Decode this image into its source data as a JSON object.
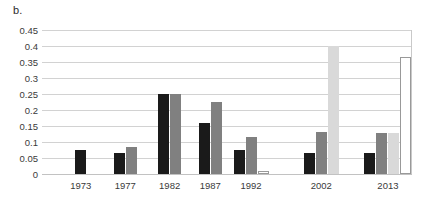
{
  "figure": {
    "panel_label": "b."
  },
  "chart_data": {
    "type": "bar",
    "title": "b.",
    "xlabel": "",
    "ylabel": "",
    "ylim": [
      0,
      0.45
    ],
    "grid": true,
    "legend": "none",
    "ytick_labels": [
      "0",
      "0.05",
      "0.1",
      "0.15",
      "0.2",
      "0.25",
      "0.3",
      "0.35",
      "0.4",
      "0.45"
    ],
    "ytick_values": [
      0,
      0.05,
      0.1,
      0.15,
      0.2,
      0.25,
      0.3,
      0.35,
      0.4,
      0.45
    ],
    "categories": [
      "1973",
      "1977",
      "1982",
      "1987",
      "1992",
      "2002",
      "2013"
    ],
    "category_positions": [
      0.105,
      0.225,
      0.345,
      0.455,
      0.565,
      0.755,
      0.935
    ],
    "series": [
      {
        "name": "series-1",
        "color": "#1a1a1a",
        "values": [
          0.075,
          0.065,
          0.25,
          0.158,
          0.075,
          0.065,
          0.065
        ]
      },
      {
        "name": "series-2",
        "color": "#808080",
        "values": [
          null,
          0.085,
          0.25,
          0.225,
          0.117,
          0.13,
          0.128
        ]
      },
      {
        "name": "series-3",
        "color": "#d9d9d9",
        "values": [
          null,
          null,
          null,
          null,
          null,
          0.4,
          0.128
        ]
      },
      {
        "name": "series-4",
        "color": "#ffffff",
        "values": [
          null,
          null,
          null,
          null,
          0.01,
          null,
          0.365
        ]
      }
    ]
  }
}
